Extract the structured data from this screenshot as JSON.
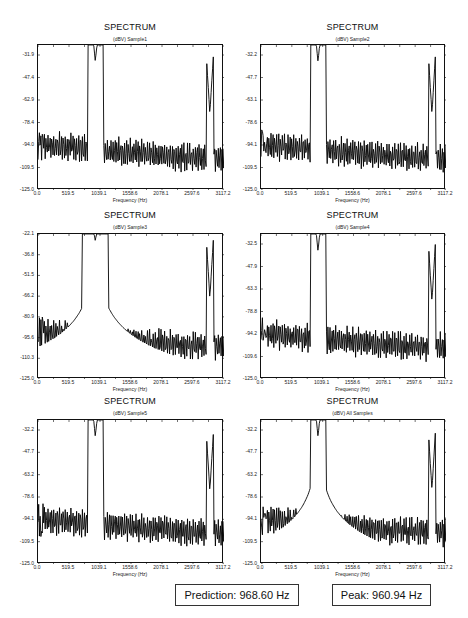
{
  "chart_data": [
    {
      "type": "line",
      "title": "SPECTRUM",
      "subtitle": "(dBV) Sample1",
      "xlabel": "Frequency (Hz)",
      "ylabel": "dBV",
      "x_ticks": [
        "0.0",
        "519.5",
        "1039.1",
        "1558.6",
        "2078.1",
        "2597.6",
        "3117.2"
      ],
      "y_ticks": [
        "-31.9",
        "-47.4",
        "-62.9",
        "-78.4",
        "-94.0",
        "-109.5",
        "-125.0"
      ],
      "xlim": [
        0,
        3117.2
      ],
      "ylim": [
        -125.0,
        -20.0
      ],
      "peaks": [
        {
          "x": 960.9,
          "y": -31.9
        },
        {
          "x": 2880,
          "y": -70
        }
      ],
      "noise_floor_low_freq": [
        -80,
        -105
      ],
      "noise_floor_high_freq": [
        -98,
        -122
      ]
    },
    {
      "type": "line",
      "title": "SPECTRUM",
      "subtitle": "(dBV) Sample2",
      "xlabel": "Frequency (Hz)",
      "ylabel": "dBV",
      "x_ticks": [
        "0.0",
        "519.5",
        "1039.1",
        "1558.6",
        "2078.1",
        "2597.6",
        "3117.2"
      ],
      "y_ticks": [
        "-32.2",
        "-47.7",
        "-63.1",
        "-78.6",
        "-94.1",
        "-109.5",
        "-125.0"
      ],
      "xlim": [
        0,
        3117.2
      ],
      "ylim": [
        -125.0,
        -20.0
      ],
      "peaks": [
        {
          "x": 960.9,
          "y": -32.2
        },
        {
          "x": 2880,
          "y": -70
        }
      ],
      "noise_floor_low_freq": [
        -80,
        -105
      ],
      "noise_floor_high_freq": [
        -98,
        -122
      ]
    },
    {
      "type": "line",
      "title": "SPECTRUM",
      "subtitle": "(dBV) Sample3",
      "xlabel": "Frequency (Hz)",
      "ylabel": "dBV",
      "x_ticks": [
        "0.0",
        "519.5",
        "1039.1",
        "1558.6",
        "2078.1",
        "2597.6",
        "3117.2"
      ],
      "y_ticks": [
        "-22.1",
        "-36.8",
        "-51.5",
        "-66.2",
        "-80.9",
        "-95.6",
        "-110.3",
        "-125.0"
      ],
      "xlim": [
        0,
        3117.2
      ],
      "ylim": [
        -125.0,
        -22.1
      ],
      "peaks": [
        {
          "x": 960.9,
          "y": -27
        },
        {
          "x": 2880,
          "y": -68
        }
      ],
      "noise_floor_low_freq": [
        -85,
        -105
      ],
      "noise_floor_high_freq": [
        -98,
        -118
      ]
    },
    {
      "type": "line",
      "title": "SPECTRUM",
      "subtitle": "(dBV) Sample4",
      "xlabel": "Frequency (Hz)",
      "ylabel": "dBV",
      "x_ticks": [
        "0.0",
        "519.5",
        "1039.1",
        "1558.6",
        "2078.1",
        "2597.6",
        "3117.2"
      ],
      "y_ticks": [
        "-32.5",
        "-47.9",
        "-63.3",
        "-78.8",
        "-94.2",
        "-109.6",
        "-125.0"
      ],
      "xlim": [
        0,
        3117.2
      ],
      "ylim": [
        -125.0,
        -20.0
      ],
      "peaks": [
        {
          "x": 960.9,
          "y": -32.5
        },
        {
          "x": 2880,
          "y": -69
        }
      ],
      "noise_floor_low_freq": [
        -80,
        -105
      ],
      "noise_floor_high_freq": [
        -98,
        -122
      ]
    },
    {
      "type": "line",
      "title": "SPECTRUM",
      "subtitle": "(dBV) Sample5",
      "xlabel": "Frequency (Hz)",
      "ylabel": "dBV",
      "x_ticks": [
        "0.0",
        "519.5",
        "1039.1",
        "1558.6",
        "2078.1",
        "2597.6",
        "3117.2"
      ],
      "y_ticks": [
        "-32.2",
        "-47.7",
        "-63.2",
        "-78.6",
        "-94.1",
        "-109.5",
        "-125.0"
      ],
      "xlim": [
        0,
        3117.2
      ],
      "ylim": [
        -125.0,
        -20.0
      ],
      "peaks": [
        {
          "x": 960.9,
          "y": -32.2
        },
        {
          "x": 2880,
          "y": -72
        }
      ],
      "noise_floor_low_freq": [
        -80,
        -105
      ],
      "noise_floor_high_freq": [
        -98,
        -122
      ]
    },
    {
      "type": "line",
      "title": "SPECTRUM",
      "subtitle": "(dBV) All Samples",
      "xlabel": "Frequency (Hz)",
      "ylabel": "dBV",
      "x_ticks": [
        "0.0",
        "519.5",
        "1039.1",
        "1558.6",
        "2078.1",
        "2597.6",
        "3117.2"
      ],
      "y_ticks": [
        "-32.2",
        "-47.7",
        "-63.2",
        "-78.6",
        "-94.1",
        "-109.5",
        "-125.0"
      ],
      "xlim": [
        0,
        3117.2
      ],
      "ylim": [
        -125.0,
        -20.0
      ],
      "peaks": [
        {
          "x": 960.9,
          "y": -32.2
        },
        {
          "x": 2880,
          "y": -71
        }
      ],
      "noise_floor_low_freq": [
        -80,
        -105
      ],
      "noise_floor_high_freq": [
        -98,
        -122
      ]
    }
  ],
  "results": {
    "prediction": "Prediction: 968.60 Hz",
    "peak": "Peak: 960.94 Hz"
  }
}
